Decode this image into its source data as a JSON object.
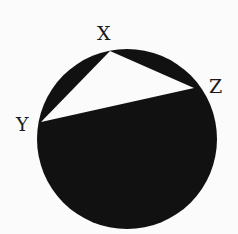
{
  "diagram": {
    "type": "inscribed-triangle-in-circle",
    "colors": {
      "background": "#fbfbfb",
      "circle_fill": "#111111",
      "triangle_fill": "#fbfbfb",
      "label": "#1a1a1a"
    },
    "circle": {
      "cx": 127,
      "cy": 139,
      "r": 90
    },
    "points": [
      {
        "name": "X",
        "x": 110,
        "y": 51,
        "label_x": 97,
        "label_y": 40
      },
      {
        "name": "Z",
        "x": 194,
        "y": 88,
        "label_x": 209,
        "label_y": 93
      },
      {
        "name": "Y",
        "x": 41,
        "y": 122,
        "label_x": 16,
        "label_y": 131
      }
    ]
  }
}
